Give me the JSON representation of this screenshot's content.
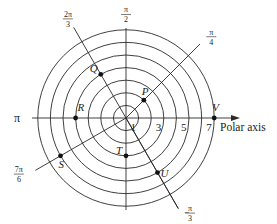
{
  "diagram": {
    "axis_label": "Polar axis",
    "pi_label": "π",
    "ring_count": 7,
    "ring_labels": [
      {
        "r": 1,
        "text": "1"
      },
      {
        "r": 3,
        "text": "3"
      },
      {
        "r": 5,
        "text": "5"
      },
      {
        "r": 7,
        "text": "7"
      }
    ],
    "rays": [
      {
        "name": "ray-2pi-3",
        "angle_pi": 0.6667,
        "num": "2π",
        "den": "3"
      },
      {
        "name": "ray-pi-2",
        "angle_pi": 0.5,
        "num": "π",
        "den": "2"
      },
      {
        "name": "ray-pi-4",
        "angle_pi": 0.25,
        "num": "π",
        "den": "4"
      },
      {
        "name": "ray-7pi-6",
        "angle_pi": 1.1667,
        "num": "7π",
        "den": "6"
      },
      {
        "name": "ray-neg-pi-3",
        "angle_pi": -0.3333,
        "num": "π",
        "den": "3",
        "sign": "−"
      }
    ],
    "points": [
      {
        "label": "P",
        "r": 2,
        "angle_pi": 0.25
      },
      {
        "label": "Q",
        "r": 4,
        "angle_pi": 0.6667
      },
      {
        "label": "R",
        "r": 4,
        "angle_pi": 1.0
      },
      {
        "label": "S",
        "r": 6,
        "angle_pi": 1.1667
      },
      {
        "label": "T",
        "r": 3,
        "angle_pi": 1.5
      },
      {
        "label": "U",
        "r": 5,
        "angle_pi": -0.3333
      },
      {
        "label": "V",
        "r": 7,
        "angle_pi": 0.0
      }
    ],
    "colors": {
      "line": "#2a2a2a",
      "point": "#111111",
      "text": "#222222"
    }
  }
}
